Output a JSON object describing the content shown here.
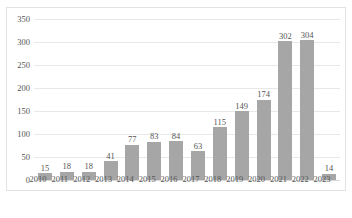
{
  "chart_data": {
    "type": "bar",
    "title": "",
    "subtitle": "",
    "xlabel": "",
    "ylabel": "",
    "categories": [
      "2010",
      "2011",
      "2012",
      "2013",
      "2014",
      "2015",
      "2016",
      "2017",
      "2018",
      "2019",
      "2020",
      "2021",
      "2022",
      "2023"
    ],
    "values": [
      15,
      18,
      18,
      41,
      77,
      83,
      84,
      63,
      115,
      149,
      174,
      302,
      304,
      14
    ],
    "ylim": [
      0,
      350
    ],
    "yticks": [
      0,
      50,
      100,
      150,
      200,
      250,
      300,
      350
    ],
    "ytick_labels": [
      "0",
      "50",
      "100",
      "150",
      "200",
      "250",
      "300",
      "350"
    ],
    "data_labels": [
      "15",
      "18",
      "18",
      "41",
      "77",
      "83",
      "84",
      "63",
      "115",
      "149",
      "174",
      "302",
      "304",
      "14"
    ],
    "grid": true,
    "grid_axis": "y",
    "legend": false,
    "legend_position": "none",
    "series": [
      {
        "name": "",
        "values": [
          15,
          18,
          18,
          41,
          77,
          83,
          84,
          63,
          115,
          149,
          174,
          302,
          304,
          14
        ],
        "color": "#a6a6a6"
      }
    ],
    "colors": {
      "bar": "#a6a6a6",
      "gridline": "#e8e8e8",
      "frame": "#e2e2e2",
      "text": "#555555"
    }
  },
  "caption": {
    "text": ""
  }
}
